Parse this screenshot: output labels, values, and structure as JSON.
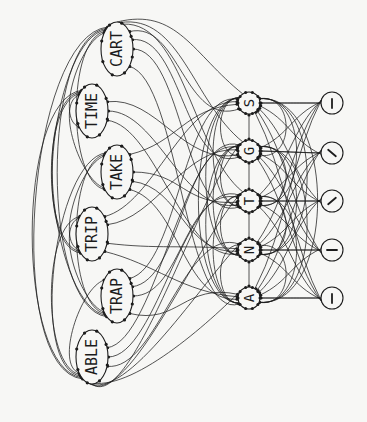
{
  "diagram": {
    "colors": {
      "ink": "#1c1c1c",
      "paper": "#f7f7f5"
    },
    "levels": {
      "word": {
        "nodes": [
          {
            "id": "CART",
            "label": "CART",
            "cx": 117,
            "cy": 49,
            "rx": 16,
            "ry": 27
          },
          {
            "id": "TIME",
            "label": "TIME",
            "cx": 92,
            "cy": 111,
            "rx": 16,
            "ry": 27
          },
          {
            "id": "TAKE",
            "label": "TAKE",
            "cx": 117,
            "cy": 172,
            "rx": 16,
            "ry": 27
          },
          {
            "id": "TRIP",
            "label": "TRIP",
            "cx": 92,
            "cy": 234,
            "rx": 16,
            "ry": 27
          },
          {
            "id": "TRAP",
            "label": "TRAP",
            "cx": 117,
            "cy": 296,
            "rx": 16,
            "ry": 27
          },
          {
            "id": "ABLE",
            "label": "ABLE",
            "cx": 92,
            "cy": 357,
            "rx": 16,
            "ry": 27
          }
        ]
      },
      "letter": {
        "nodes": [
          {
            "id": "S",
            "label": "S",
            "cx": 249,
            "cy": 103,
            "r": 11
          },
          {
            "id": "G",
            "label": "G",
            "cx": 249,
            "cy": 151,
            "r": 11
          },
          {
            "id": "T",
            "label": "T",
            "cx": 249,
            "cy": 201,
            "r": 11
          },
          {
            "id": "N",
            "label": "N",
            "cx": 249,
            "cy": 250,
            "r": 11
          },
          {
            "id": "A",
            "label": "A",
            "cx": 249,
            "cy": 298,
            "r": 11
          }
        ]
      },
      "feature": {
        "nodes": [
          {
            "id": "f1",
            "glyph": "vertical-stroke",
            "angle": 0,
            "cx": 332,
            "cy": 103,
            "r": 11
          },
          {
            "id": "f2",
            "glyph": "diagonal-stroke",
            "angle": 50,
            "cx": 332,
            "cy": 153,
            "r": 11
          },
          {
            "id": "f3",
            "glyph": "diagonal-stroke",
            "angle": -50,
            "cx": 332,
            "cy": 201,
            "r": 11
          },
          {
            "id": "f4",
            "glyph": "horizontal-stroke",
            "angle": 90,
            "cx": 332,
            "cy": 250,
            "r": 11
          },
          {
            "id": "f5",
            "glyph": "vertical-stroke",
            "angle": 0,
            "cx": 332,
            "cy": 298,
            "r": 11
          }
        ]
      }
    }
  }
}
